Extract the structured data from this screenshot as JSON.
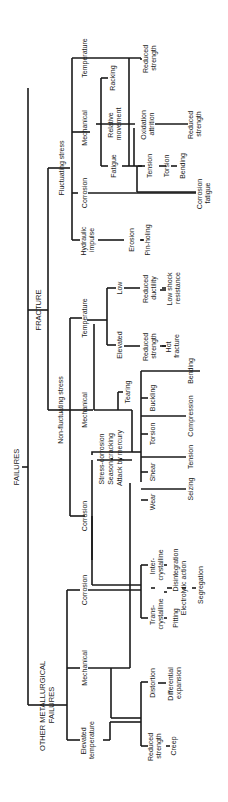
{
  "diagram": {
    "title": "FAILURES",
    "orientation": "rotated 90 degrees counter-clockwise",
    "nodes": {
      "root": "FAILURES",
      "fracture": "FRACTURE",
      "other": [
        "OTHER METALLURGICAL",
        "FAILURES"
      ],
      "fluctuating": "Fluctuating stress",
      "non_fluctuating": "Non-fluctuating stress",
      "fl_temperature": "Temperature",
      "fl_mechanical": "Mechanical",
      "fl_corrosion": "Corrosion",
      "fl_hydraulic": [
        "Hydraulic",
        "impulse"
      ],
      "racking": "Racking",
      "relative_movement": [
        "Relative",
        "movement"
      ],
      "fatigue": "Fatigue",
      "fl_reduced_strength_1": [
        "Reduced",
        "strength"
      ],
      "oxidation_attrition": [
        "Oxidation",
        "attrition"
      ],
      "fl_reduced_strength_2": [
        "Reduced",
        "strength"
      ],
      "tension_f": "Tension",
      "torsion_f": "Torsion",
      "bending_f": "Bending",
      "corrosion_fatigue": [
        "Corrosion",
        "fatigue"
      ],
      "erosion": "Erosion",
      "pin_holing": "Pin-holing",
      "nf_temperature": "Temperature",
      "nf_mechanical": "Mechanical",
      "nf_corrosion": "Corrosion",
      "low": "Low",
      "elevated": "Elevated",
      "reduced_ductility": [
        "Reduced",
        "ductility"
      ],
      "low_shock": [
        "Low shock",
        "resistance"
      ],
      "nf_reduced_strength": [
        "Reduced",
        "strength"
      ],
      "hot_fracture": [
        "Hot",
        "fracture"
      ],
      "tearing": "Tearing",
      "buckling": "Buckling",
      "torsion_nf": "Torsion",
      "shear": "Shear",
      "wear": "Wear",
      "bending_nf": "Bending",
      "compression": "Compression",
      "tension_nf": "Tension",
      "seizing": "Seizing",
      "stress_corrosion": [
        "Stress-corrosion",
        "Season cracking",
        "Attack by mercury"
      ],
      "om_corrosion": "Corrosion",
      "om_mechanical": "Mechanical",
      "om_elevated": [
        "Elevated",
        "temperature"
      ],
      "inter_crystalline": [
        "Inter-",
        "crystalline"
      ],
      "trans_crystalline": [
        "Trans-",
        "crystalline"
      ],
      "disintegration": "Disintegration",
      "pitting": "Pitting",
      "electrolytic": "Electrolytic action",
      "segregation": "Segregation",
      "distortion": "Distortion",
      "differential_expansion": [
        "Differential",
        "expansion"
      ],
      "om_reduced_strength": [
        "Reduced",
        "strength"
      ],
      "creep": "Creep"
    }
  }
}
